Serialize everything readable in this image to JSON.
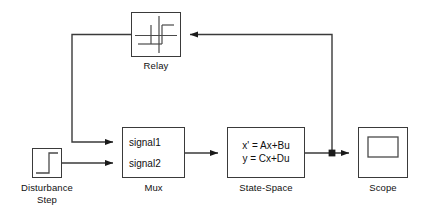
{
  "diagram": {
    "background_color": "#ffffff",
    "line_color": "#3a3a3a",
    "text_color": "#111111"
  },
  "blocks": {
    "relay": {
      "label": "Relay",
      "icon": "relay-hysteresis-icon",
      "x": 131,
      "y": 12,
      "w": 50,
      "h": 45
    },
    "step": {
      "label_line1": "Disturbance",
      "label_line2": "Step",
      "icon": "step-signal-icon",
      "x": 32,
      "y": 148,
      "w": 30,
      "h": 30
    },
    "mux": {
      "label": "Mux",
      "input1": "signal1",
      "input2": "signal2",
      "x": 122,
      "y": 127,
      "w": 63,
      "h": 51
    },
    "state_space": {
      "label": "State-Space",
      "equation_line1": "x' = Ax+Bu",
      "equation_line2": "y = Cx+Du",
      "x": 227,
      "y": 127,
      "w": 78,
      "h": 51
    },
    "scope": {
      "label": "Scope",
      "icon": "scope-screen-icon",
      "x": 358,
      "y": 127,
      "w": 50,
      "h": 51
    }
  },
  "signals": [
    {
      "name": "step-to-mux-signal2",
      "from": "step",
      "to": "mux.signal2"
    },
    {
      "name": "relay-to-mux-signal1",
      "from": "relay",
      "to": "mux.signal1"
    },
    {
      "name": "mux-to-state-space",
      "from": "mux",
      "to": "state_space"
    },
    {
      "name": "state-space-to-scope",
      "from": "state_space",
      "to": "scope"
    },
    {
      "name": "state-space-feedback-to-relay",
      "from": "state_space",
      "to": "relay"
    }
  ],
  "junction": {
    "name": "feedback-branch-point",
    "x": 332,
    "y": 153
  }
}
